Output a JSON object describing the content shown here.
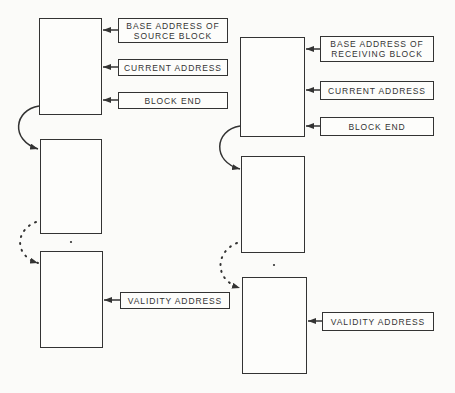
{
  "diagram": {
    "source": {
      "labels": {
        "base_address": "BASE ADDRESS OF\nSOURCE BLOCK",
        "current_address": "CURRENT ADDRESS",
        "block_end": "BLOCK END",
        "validity_address": "VALIDITY ADDRESS"
      }
    },
    "receiving": {
      "labels": {
        "base_address": "BASE ADDRESS OF\nRECEIVING BLOCK",
        "current_address": "CURRENT ADDRESS",
        "block_end": "BLOCK END",
        "validity_address": "VALIDITY ADDRESS"
      }
    },
    "colors": {
      "line": "#333333",
      "background": "#fbfbf9"
    }
  }
}
